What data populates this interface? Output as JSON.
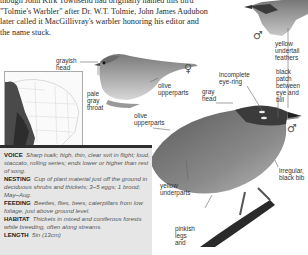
{
  "intro": {
    "lines": [
      "though John Kirk Townsend had originally named this bird",
      "\"Tolmie's Warbler\" after Dr. W.T. Tolmie,  John James Audubon",
      "later called it MacGillivray's warbler honoring his editor and",
      "the name stuck."
    ]
  },
  "symbols": {
    "male": "♂",
    "female": "♀"
  },
  "labels": {
    "yellow_undertail": [
      "yellow",
      "undertail",
      "feathers"
    ],
    "black_patch": [
      "black patch",
      "between",
      "eye and bill"
    ],
    "grayish_head": [
      "grayish",
      "head"
    ],
    "pale_gray_throat": [
      "pale",
      "gray",
      "throat"
    ],
    "olive_upperparts_female": [
      "olive",
      "upperparts"
    ],
    "olive_upperparts_male": [
      "olive",
      "upperparts"
    ],
    "incomplete_eye_ring": [
      "incomplete",
      "eye-ring"
    ],
    "gray_head": [
      "gray",
      "head"
    ],
    "irregular_black_bib": [
      "irregular,",
      "black bib"
    ],
    "yellow_underparts": [
      "yellow",
      "underparts"
    ],
    "pinkish_legs": [
      "pinkish",
      "legs",
      "and"
    ]
  },
  "facts": [
    {
      "heading": "VOICE",
      "text": "Sharp tsaik; high, thin, clear svit in flight; loud, staccato, rolling series; ends lower or higher than rest of song."
    },
    {
      "heading": "NESTING",
      "text": "Cup of plant material just off the ground in deciduous shrubs and thickets; 3–5 eggs; 1 brood; May–Aug."
    },
    {
      "heading": "FEEDING",
      "text": "Beetles, flies, bees, caterpillars from low foliage, just above ground level."
    },
    {
      "heading": "HABITAT",
      "text": "Thickets in mixed and coniferous forests while breeding, often along streams."
    },
    {
      "heading": "LENGTH",
      "text": "5in (13cm)"
    }
  ],
  "colors": {
    "panel_bg": "#e6e6e6",
    "panel_bar": "#2e2e2e",
    "text": "#2a2a2a"
  }
}
